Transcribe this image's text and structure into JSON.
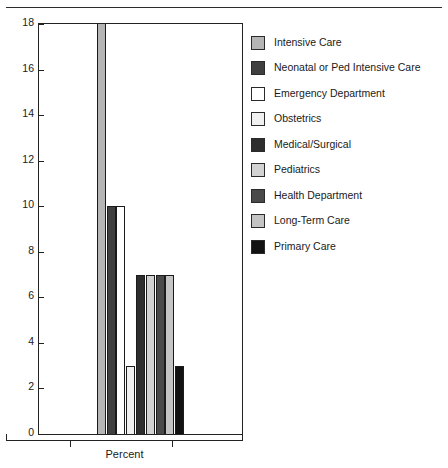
{
  "chart_data": {
    "type": "bar",
    "title": "",
    "subtitle": "",
    "xlabel": "Percent",
    "ylabel": "",
    "ylim": [
      0,
      18
    ],
    "y_ticks": [
      0,
      2,
      4,
      6,
      8,
      10,
      12,
      14,
      16,
      18
    ],
    "x_ticks": [],
    "grid": false,
    "legend_position": "right",
    "categories": [
      "Intensive Care",
      "Neonatal or Ped Intensive Care",
      "Emergency Department",
      "Obstetrics",
      "Medical/Surgical",
      "Pediatrics",
      "Health Department",
      "Long-Term Care",
      "Primary Care"
    ],
    "values": [
      18,
      10,
      10,
      3,
      7,
      7,
      7,
      7,
      3
    ],
    "colors": [
      "#b5b5b5",
      "#3f3f3f",
      "#ffffff",
      "#f0f0f0",
      "#2e2e2e",
      "#d2d2d2",
      "#4a4a4a",
      "#c4c4c4",
      "#121212"
    ],
    "note_truncated": "Intensive Care bar reaches the top of the axis at 18"
  },
  "axis": {
    "y_tick_labels": [
      "18",
      "16",
      "14",
      "12",
      "10",
      "8",
      "6",
      "4",
      "2",
      "0"
    ],
    "x_label": "Percent"
  },
  "legend": {
    "items": [
      {
        "label": "Intensive Care",
        "color": "#b5b5b5"
      },
      {
        "label": "Neonatal or Ped Intensive Care",
        "color": "#3f3f3f"
      },
      {
        "label": "Emergency Department",
        "color": "#ffffff"
      },
      {
        "label": "Obstetrics",
        "color": "#f0f0f0"
      },
      {
        "label": "Medical/Surgical",
        "color": "#2e2e2e"
      },
      {
        "label": "Pediatrics",
        "color": "#d2d2d2"
      },
      {
        "label": "Health Department",
        "color": "#4a4a4a"
      },
      {
        "label": "Long-Term Care",
        "color": "#c4c4c4"
      },
      {
        "label": "Primary Care",
        "color": "#121212"
      }
    ]
  }
}
